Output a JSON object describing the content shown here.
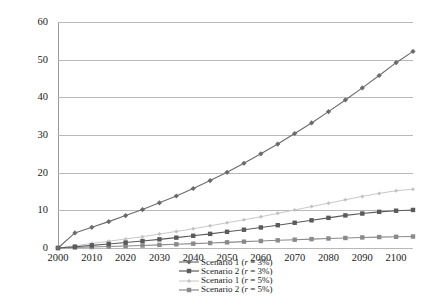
{
  "chart_data": {
    "type": "line",
    "title": "",
    "xlabel": "",
    "ylabel": "",
    "xlim": [
      2000,
      2105
    ],
    "ylim": [
      0,
      60
    ],
    "yticks": [
      0,
      10,
      20,
      30,
      40,
      50,
      60
    ],
    "xticks": [
      2000,
      2010,
      2020,
      2030,
      2040,
      2050,
      2060,
      2070,
      2080,
      2090,
      2100
    ],
    "grid": true,
    "legend_position": "bottom",
    "x": [
      2000,
      2005,
      2010,
      2015,
      2020,
      2025,
      2030,
      2035,
      2040,
      2045,
      2050,
      2055,
      2060,
      2065,
      2070,
      2075,
      2080,
      2085,
      2090,
      2095,
      2100,
      2105
    ],
    "series": [
      {
        "name": "Scenario 1 (r = 3%)",
        "label_prefix": "Scenario 1 (",
        "label_var": "r",
        "label_suffix": " = 3%)",
        "color": "#6b6b6b",
        "marker": "diamond",
        "values": [
          0,
          4.0,
          5.5,
          7.0,
          8.6,
          10.2,
          12.0,
          13.8,
          15.8,
          17.9,
          20.1,
          22.5,
          25.0,
          27.6,
          30.4,
          33.2,
          36.2,
          39.3,
          42.5,
          45.8,
          49.2,
          52.2
        ]
      },
      {
        "name": "Scenario 2 (r = 3%)",
        "label_prefix": "Scenario 2 (",
        "label_var": "r",
        "label_suffix": " = 3%)",
        "color": "#5a5a5a",
        "marker": "square",
        "values": [
          0,
          0.35,
          0.7,
          1.05,
          1.45,
          1.85,
          2.3,
          2.75,
          3.25,
          3.75,
          4.3,
          4.85,
          5.45,
          6.05,
          6.7,
          7.35,
          8.0,
          8.65,
          9.15,
          9.6,
          9.9,
          10.1
        ]
      },
      {
        "name": "Scenario 1 (r = 5%)",
        "label_prefix": "Scenario 1 (",
        "label_var": "r",
        "label_suffix": " = 5%)",
        "color": "#c2c2c2",
        "marker": "small-diamond",
        "values": [
          0,
          0.6,
          1.2,
          1.8,
          2.4,
          3.0,
          3.7,
          4.4,
          5.1,
          5.9,
          6.7,
          7.5,
          8.3,
          9.2,
          10.1,
          11.0,
          11.9,
          12.8,
          13.7,
          14.5,
          15.2,
          15.6
        ]
      },
      {
        "name": "Scenario 2 (r = 5%)",
        "label_prefix": "Scenario 2 (",
        "label_var": "r",
        "label_suffix": " = 5%)",
        "color": "#8a8a8a",
        "marker": "square",
        "values": [
          0,
          0.12,
          0.25,
          0.38,
          0.52,
          0.66,
          0.82,
          0.98,
          1.15,
          1.32,
          1.5,
          1.68,
          1.86,
          2.04,
          2.2,
          2.36,
          2.52,
          2.66,
          2.8,
          2.9,
          2.98,
          3.05
        ]
      }
    ]
  }
}
